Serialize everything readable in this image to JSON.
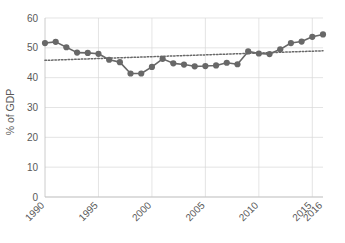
{
  "chart_data": {
    "type": "line",
    "title": "",
    "subtitle": "",
    "xlabel": "",
    "ylabel": "% of GDP",
    "ylim": [
      0,
      60
    ],
    "xlim": [
      1990,
      2016
    ],
    "yticks": [
      0,
      10,
      20,
      30,
      40,
      50,
      60
    ],
    "ytick_labels": [
      "0",
      "10",
      "20",
      "30",
      "40",
      "50",
      "60"
    ],
    "xticks": [
      1990,
      1995,
      2000,
      2005,
      2010,
      2015,
      2016
    ],
    "xtick_labels": [
      "1990",
      "1995",
      "2000",
      "2005",
      "2010",
      "2015",
      "2016"
    ],
    "xtick_rotation": 45,
    "grid": "horizontal-and-vertical",
    "legend": "none",
    "x": [
      1990,
      1991,
      1992,
      1993,
      1994,
      1995,
      1996,
      1997,
      1998,
      1999,
      2000,
      2001,
      2002,
      2003,
      2004,
      2005,
      2006,
      2007,
      2008,
      2009,
      2010,
      2011,
      2012,
      2013,
      2014,
      2015,
      2016
    ],
    "series": [
      {
        "name": "% of GDP",
        "style": "line-with-markers",
        "color": "#686868",
        "values": [
          51.6,
          52.0,
          50.2,
          48.4,
          48.3,
          48.0,
          46.0,
          45.2,
          41.4,
          41.4,
          43.6,
          46.3,
          44.8,
          44.4,
          43.8,
          43.9,
          44.1,
          45.0,
          44.5,
          48.8,
          48.1,
          47.9,
          49.5,
          51.6,
          52.1,
          53.7,
          54.5
        ]
      },
      {
        "name": "Trendline",
        "style": "dotted-trendline",
        "color": "#686868",
        "endpoints": [
          {
            "x": 1990,
            "y": 45.8
          },
          {
            "x": 2016,
            "y": 49.0
          }
        ]
      }
    ]
  },
  "axes": {
    "y_title": "% of GDP"
  }
}
